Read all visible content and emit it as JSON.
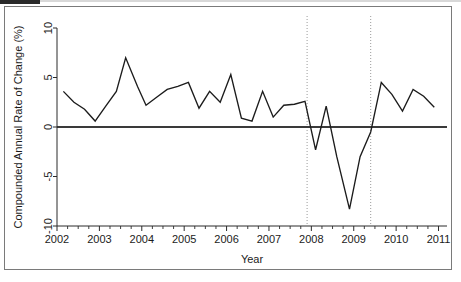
{
  "figure": {
    "background_color": "#ffffff",
    "frame_color": "#7a7a7a",
    "has_outer_frame": true
  },
  "chart_data": {
    "type": "line",
    "title": "",
    "subtitle": "",
    "xlabel": "Year",
    "ylabel": "Compounded Annual Rate of Change (%)",
    "xlim": [
      2002.0,
      2011.2
    ],
    "ylim": [
      -10,
      10
    ],
    "yticks": [
      -10,
      -5,
      0,
      5,
      10
    ],
    "ytick_labels": [
      "-10",
      "-5",
      "0",
      "5",
      "10"
    ],
    "xticks": [
      2002,
      2003,
      2004,
      2005,
      2006,
      2007,
      2008,
      2009,
      2010,
      2011
    ],
    "xtick_labels": [
      "2002",
      "2003",
      "2004",
      "2005",
      "2006",
      "2007",
      "2008",
      "2009",
      "2010",
      "2011"
    ],
    "minor_ticks_per_interval": 3,
    "grid": false,
    "legend": null,
    "legend_position": "none",
    "series_color": "#1c1c1c",
    "zero_line": {
      "value": 0,
      "color": "#3a3a3a",
      "width": 2
    },
    "annotations": [
      {
        "name": "recession-start",
        "type": "vertical-dotted-line",
        "x": 2007.9,
        "color": "#9a9a9a"
      },
      {
        "name": "recession-end",
        "type": "vertical-dotted-line",
        "x": 2009.4,
        "color": "#9a9a9a"
      }
    ],
    "x": [
      2002.15,
      2002.4,
      2002.65,
      2002.9,
      2003.15,
      2003.4,
      2003.62,
      2003.9,
      2004.1,
      2004.35,
      2004.6,
      2004.85,
      2005.1,
      2005.35,
      2005.6,
      2005.85,
      2006.1,
      2006.35,
      2006.6,
      2006.85,
      2007.1,
      2007.35,
      2007.6,
      2007.85,
      2008.1,
      2008.35,
      2008.6,
      2008.9,
      2009.15,
      2009.4,
      2009.65,
      2009.9,
      2010.15,
      2010.4,
      2010.65,
      2010.9
    ],
    "values": [
      3.6,
      2.5,
      1.8,
      0.6,
      2.1,
      3.6,
      7.0,
      4.1,
      2.2,
      3.0,
      3.8,
      4.1,
      4.5,
      1.9,
      3.6,
      2.5,
      5.3,
      0.9,
      0.6,
      3.6,
      1.0,
      2.2,
      2.3,
      2.6,
      -2.3,
      2.1,
      -3.0,
      -8.3,
      -3.0,
      -0.5,
      4.5,
      3.3,
      1.6,
      3.8,
      3.1,
      2.0
    ],
    "series": [
      {
        "name": "Compounded Annual Rate of Change",
        "color": "#1c1c1c",
        "values": [
          3.6,
          2.5,
          1.8,
          0.6,
          2.1,
          3.6,
          7.0,
          4.1,
          2.2,
          3.0,
          3.8,
          4.1,
          4.5,
          1.9,
          3.6,
          2.5,
          5.3,
          0.9,
          0.6,
          3.6,
          1.0,
          2.2,
          2.3,
          2.6,
          -2.3,
          2.1,
          -3.0,
          -8.3,
          -3.0,
          -0.5,
          4.5,
          3.3,
          1.6,
          3.8,
          3.1,
          2.0
        ]
      }
    ]
  }
}
